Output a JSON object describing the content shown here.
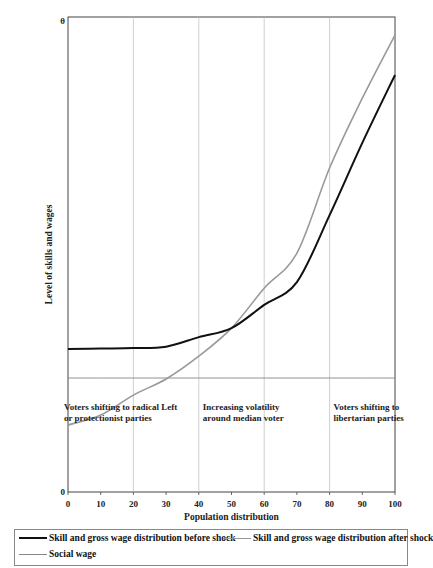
{
  "chart_data": {
    "type": "line",
    "title": "",
    "xlabel": "Population distribution",
    "ylabel": "Level of skills and wages",
    "xlim": [
      0,
      100
    ],
    "ylim": [
      0,
      100
    ],
    "x_ticks": [
      0,
      10,
      20,
      30,
      40,
      50,
      60,
      70,
      80,
      90,
      100
    ],
    "y_tick_labels": [
      {
        "value": 0,
        "label": "0"
      },
      {
        "value": 100,
        "label": "θ"
      }
    ],
    "grid": {
      "vertical_at": [
        20,
        40,
        60,
        80
      ],
      "horizontal": false
    },
    "x": [
      0,
      10,
      20,
      30,
      40,
      50,
      60,
      70,
      80,
      90,
      100
    ],
    "series": [
      {
        "name": "Skill and gross wage distribution before shock",
        "color": "#111111",
        "width": 2,
        "values": [
          30.1,
          30.2,
          30.3,
          30.6,
          32.6,
          34.5,
          39.4,
          44.2,
          58.3,
          73.5,
          87.8
        ]
      },
      {
        "name": "Skill and gross wage distribution after shock",
        "color": "#999999",
        "width": 1.6,
        "values": [
          14.1,
          16.2,
          20.4,
          23.8,
          28.6,
          34.5,
          42.9,
          50.3,
          68.2,
          82.9,
          96.2
        ]
      },
      {
        "name": "Social wage",
        "color": "#777777",
        "width": 0.8,
        "values": [
          24,
          24,
          24,
          24,
          24,
          24,
          24,
          24,
          24,
          24,
          24
        ]
      }
    ],
    "annotations": [
      {
        "text": [
          "Voters shifting to radical Left",
          "or protectionist parties"
        ],
        "x": 0,
        "y": 20
      },
      {
        "text": [
          "Increasing volatility",
          "around median voter"
        ],
        "x": 40,
        "y": 20
      },
      {
        "text": [
          "Voters shifting to",
          "libertarian parties"
        ],
        "x": 80,
        "y": 20
      }
    ],
    "legend_position": "bottom"
  },
  "legend": {
    "before": "Skill and gross wage distribution before shock",
    "after": "Skill and gross wage distribution after shock",
    "social": "Social wage"
  }
}
